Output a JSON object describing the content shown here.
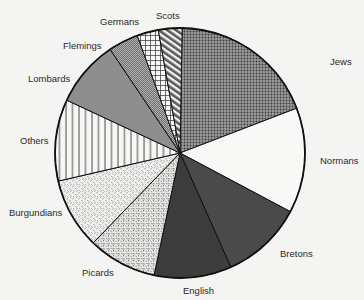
{
  "chart_data": {
    "type": "pie",
    "title": "",
    "start_angle_deg": 1,
    "direction": "clockwise",
    "slices": [
      {
        "label": "Jews",
        "angle_deg": 68,
        "percent": 18.9,
        "pattern": "dots-dark"
      },
      {
        "label": "Normans",
        "angle_deg": 49,
        "percent": 13.6,
        "pattern": "white"
      },
      {
        "label": "Bretons",
        "angle_deg": 38,
        "percent": 10.6,
        "pattern": "dark-gray"
      },
      {
        "label": "English",
        "angle_deg": 36,
        "percent": 10.0,
        "pattern": "darker-gray"
      },
      {
        "label": "Picards",
        "angle_deg": 32,
        "percent": 8.9,
        "pattern": "speckle-dense"
      },
      {
        "label": "Burgundians",
        "angle_deg": 33,
        "percent": 9.2,
        "pattern": "speckle-light"
      },
      {
        "label": "Others",
        "angle_deg": 38,
        "percent": 10.6,
        "pattern": "vertical-lines"
      },
      {
        "label": "Lombards",
        "angle_deg": 31,
        "percent": 8.6,
        "pattern": "mid-gray"
      },
      {
        "label": "Flemings",
        "angle_deg": 14,
        "percent": 3.9,
        "pattern": "fine-hatch"
      },
      {
        "label": "Germans",
        "angle_deg": 10,
        "percent": 2.8,
        "pattern": "grid"
      },
      {
        "label": "Scots",
        "angle_deg": 11,
        "percent": 3.1,
        "pattern": "diagonal-stripes"
      }
    ],
    "legend": "none (direct labels)"
  },
  "labels": {
    "jews": "Jews",
    "normans": "Normans",
    "bretons": "Bretons",
    "english": "English",
    "picards": "Picards",
    "burgundians": "Burgundians",
    "others": "Others",
    "lombards": "Lombards",
    "flemings": "Flemings",
    "germans": "Germans",
    "scots": "Scots"
  }
}
